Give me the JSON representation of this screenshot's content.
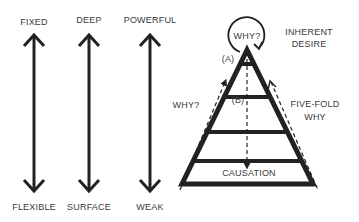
{
  "diagram": {
    "scales": [
      {
        "top": "FIXED",
        "bottom": "FLEXIBLE"
      },
      {
        "top": "DEEP",
        "bottom": "SURFACE"
      },
      {
        "top": "POWERFUL",
        "bottom": "WEAK"
      }
    ],
    "pyramid": {
      "apex_label": "WHY?",
      "apex_side_label_line1": "INHERENT",
      "apex_side_label_line2": "DESIRE",
      "marker_a": "(A)",
      "marker_b": "(B)",
      "left_label": "WHY?",
      "right_label_line1": "FIVE-FOLD",
      "right_label_line2": "WHY",
      "base_label": "CAUSATION"
    },
    "colors": {
      "stroke": "#222222",
      "text": "#3a3a3a",
      "background": "#ffffff"
    }
  }
}
